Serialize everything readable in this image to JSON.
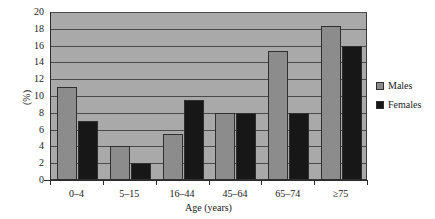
{
  "chart_data": {
    "type": "bar",
    "title": "",
    "subtitle": "",
    "xlabel": "Age (years)",
    "ylabel": "(%)",
    "categories": [
      "0–4",
      "5–15",
      "16–44",
      "45–64",
      "65–74",
      "≥75"
    ],
    "series": [
      {
        "name": "Males",
        "color": "#8c8c8c",
        "values": [
          11.1,
          4.0,
          5.5,
          8.0,
          15.3,
          18.3
        ]
      },
      {
        "name": "Females",
        "color": "#171717",
        "values": [
          7.0,
          2.0,
          9.5,
          8.0,
          8.0,
          16.0
        ]
      }
    ],
    "ylim": [
      0,
      20
    ],
    "ytick_step": 2,
    "yticks": [
      0,
      2,
      4,
      6,
      8,
      10,
      12,
      14,
      16,
      18,
      20
    ],
    "ytick_labels": [
      "0",
      "2",
      "4",
      "6",
      "8",
      "10",
      "12",
      "14",
      "16",
      "18",
      "20"
    ],
    "grid": true,
    "grid_axis": "y",
    "legend_position": "right",
    "plot_background": "#a9a9a9",
    "gridline_color": "#4a4a4a",
    "axis_color": "#2b2b2b"
  },
  "legend": {
    "entries": [
      {
        "label": "Males"
      },
      {
        "label": "Females"
      }
    ]
  }
}
